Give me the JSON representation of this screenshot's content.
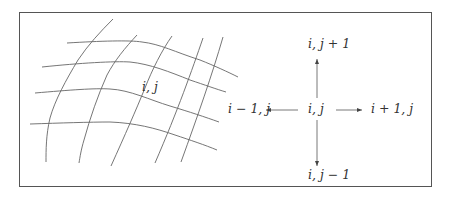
{
  "figure": {
    "grid": {
      "cell_label": "i, j",
      "horizontal_curves": 4,
      "vertical_curves": 5
    },
    "stencil": {
      "center": "i, j",
      "north": "i, j + 1",
      "south": "i, j − 1",
      "west": "i − 1, j",
      "east": "i + 1, j"
    },
    "colors": {
      "line": "#555555",
      "text": "#333333",
      "background": "#ffffff"
    }
  }
}
